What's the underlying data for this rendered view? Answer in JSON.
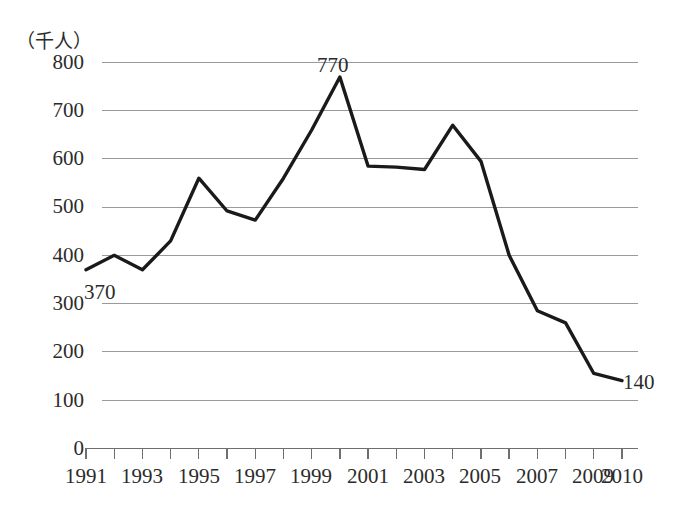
{
  "chart_data": {
    "type": "line",
    "title": "",
    "subtitle": "",
    "xlabel": "",
    "ylabel": "（千人）",
    "unit_note": "（千人）",
    "x": [
      1991,
      1992,
      1993,
      1994,
      1995,
      1996,
      1997,
      1998,
      1999,
      2000,
      2001,
      2002,
      2003,
      2004,
      2005,
      2006,
      2007,
      2008,
      2009,
      2010
    ],
    "values": [
      370,
      400,
      370,
      430,
      560,
      492,
      473,
      560,
      660,
      770,
      585,
      583,
      578,
      670,
      595,
      400,
      285,
      260,
      155,
      140
    ],
    "series": [
      {
        "name": "",
        "values": [
          370,
          400,
          370,
          430,
          560,
          492,
          473,
          560,
          660,
          770,
          585,
          583,
          578,
          670,
          595,
          400,
          285,
          260,
          155,
          140
        ]
      }
    ],
    "categories": [
      "1991",
      "1992",
      "1993",
      "1994",
      "1995",
      "1996",
      "1997",
      "1998",
      "1999",
      "2000",
      "2001",
      "2002",
      "2003",
      "2004",
      "2005",
      "2006",
      "2007",
      "2008",
      "2009",
      "2010"
    ],
    "xtick_labels": [
      "1991",
      "1993",
      "1995",
      "1997",
      "1999",
      "2001",
      "2003",
      "2005",
      "2007",
      "2009",
      "2010"
    ],
    "xtick_values": [
      1991,
      1993,
      1995,
      1997,
      1999,
      2001,
      2003,
      2005,
      2007,
      2009,
      2010
    ],
    "ytick_labels": [
      "800",
      "700",
      "600",
      "500",
      "400",
      "300",
      "200",
      "100",
      "0"
    ],
    "ytick_values": [
      800,
      700,
      600,
      500,
      400,
      300,
      200,
      100,
      0
    ],
    "ylim": [
      0,
      800
    ],
    "xlim": [
      1991,
      2010
    ],
    "grid": true,
    "grid_axis": "y",
    "legend": false,
    "legend_position": "none",
    "line_color": "#1a1a1a",
    "grid_color": "#9a9a9a",
    "axis_color": "#6f6f6f",
    "annotations": [
      {
        "text": "370",
        "x": 1991,
        "y": 370,
        "position": "below-right"
      },
      {
        "text": "770",
        "x": 2000,
        "y": 770,
        "position": "above"
      },
      {
        "text": "140",
        "x": 2010,
        "y": 140,
        "position": "below-right"
      }
    ]
  },
  "axis": {
    "y_unit_caption": "（千人）",
    "y_labels": {
      "t800": "800",
      "t700": "700",
      "t600": "600",
      "t500": "500",
      "t400": "400",
      "t300": "300",
      "t200": "200",
      "t100": "100",
      "t0": "0"
    },
    "x_labels": {
      "y1991": "1991",
      "y1993": "1993",
      "y1995": "1995",
      "y1997": "1997",
      "y1999": "1999",
      "y2001": "2001",
      "y2003": "2003",
      "y2005": "2005",
      "y2007": "2007",
      "y2009": "2009",
      "y2010": "2010"
    }
  },
  "labels": {
    "start_value": "370",
    "peak_value": "770",
    "end_value": "140"
  }
}
